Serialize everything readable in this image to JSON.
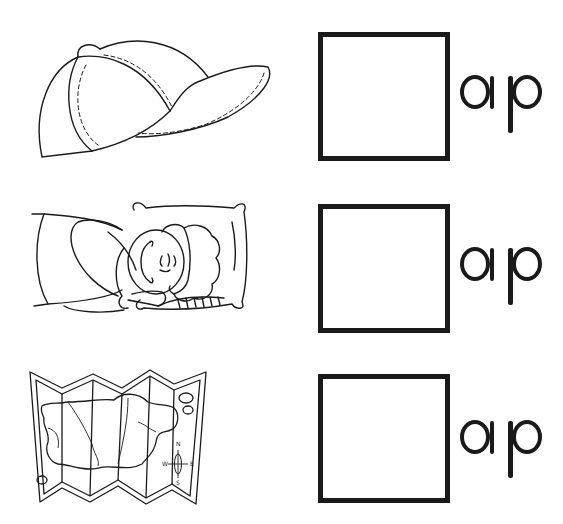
{
  "worksheet": {
    "rows": [
      {
        "picture": "cap",
        "picture_icon": "baseball-cap-illustration",
        "ending": "ap",
        "answer": ""
      },
      {
        "picture": "nap",
        "picture_icon": "sleeping-child-illustration",
        "ending": "ap",
        "answer": ""
      },
      {
        "picture": "map",
        "picture_icon": "folded-map-illustration",
        "ending": "ap",
        "answer": ""
      }
    ],
    "compass": {
      "n": "N",
      "s": "S",
      "e": "E",
      "w": "W"
    },
    "colors": {
      "ink": "#1a1a1a",
      "background": "#ffffff"
    }
  }
}
